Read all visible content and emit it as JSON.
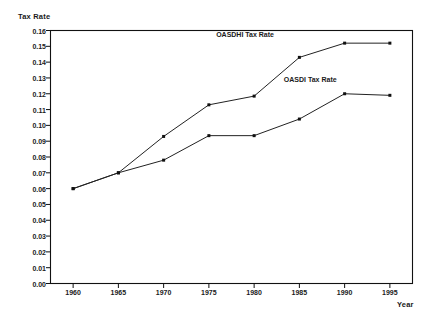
{
  "chart_data": {
    "type": "line",
    "title": "",
    "xlabel": "Year",
    "ylabel": "Tax Rate",
    "x": [
      1960,
      1965,
      1970,
      1975,
      1980,
      1985,
      1990,
      1995
    ],
    "xtick_labels": [
      "1960",
      "1965",
      "1970",
      "1975",
      "1980",
      "1985",
      "1990",
      "1995"
    ],
    "xlim": [
      1957.5,
      1997.5
    ],
    "ylim": [
      0.0,
      0.16
    ],
    "ytick_labels": [
      "0.00",
      "0.01",
      "0.02",
      "0.03",
      "0.04",
      "0.05",
      "0.06",
      "0.07",
      "0.08",
      "0.09",
      "0.10",
      "0.11",
      "0.12",
      "0.13",
      "0.14",
      "0.15",
      "0.16"
    ],
    "ytick_values": [
      0.0,
      0.01,
      0.02,
      0.03,
      0.04,
      0.05,
      0.06,
      0.07,
      0.08,
      0.09,
      0.1,
      0.11,
      0.12,
      0.13,
      0.14,
      0.15,
      0.16
    ],
    "grid": false,
    "legend_position": "inline-annotation",
    "line_color": "#222222",
    "marker_color": "#111111",
    "frame_color": "#111111",
    "background": "#ffffff",
    "series": [
      {
        "name": "OASDHI Tax Rate",
        "values": [
          0.06,
          0.07,
          0.093,
          0.113,
          0.1185,
          0.143,
          0.152,
          0.152
        ],
        "annotation": {
          "text": "OASDHI Tax Rate",
          "x": 1979.0,
          "y": 0.152
        }
      },
      {
        "name": "OASDI Tax Rate",
        "values": [
          0.06,
          0.07,
          0.078,
          0.0935,
          0.0935,
          0.104,
          0.12,
          0.119
        ],
        "annotation": {
          "text": "OASDI Tax Rate",
          "x": 1986.2,
          "y": 0.1235
        }
      }
    ]
  }
}
